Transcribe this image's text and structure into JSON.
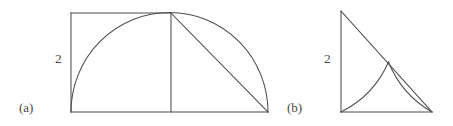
{
  "figure": {
    "background_color": "#ffffff",
    "stroke_color": "#4d4d4d",
    "panels": [
      {
        "id": "a",
        "caption": "(a)",
        "dimension_label": "2",
        "description": "Semicircle of radius 2 on a diameter, with an inscribed rectangle, a vertical radius to the apex, and a chord from the apex to the right end of the diameter.",
        "geometry": {
          "type": "semicircle-with-inscribed-rectangle",
          "center": [
            171,
            112
          ],
          "radius": 98,
          "diameter_left": [
            71,
            112
          ],
          "diameter_right": [
            268,
            112
          ],
          "apex": [
            171,
            13
          ],
          "rectangle": [
            [
              71,
              13
            ],
            [
              171,
              13
            ],
            [
              171,
              112
            ],
            [
              71,
              112
            ]
          ],
          "chord": [
            [
              171,
              13
            ],
            [
              268,
              112
            ]
          ]
        }
      },
      {
        "id": "b",
        "caption": "(b)",
        "dimension_label": "2",
        "description": "Right triangle of legs 2 with a quarter-circle arc from the bottom-left vertex and a second arc meeting it on the hypotenuse.",
        "geometry": {
          "type": "right-triangle-with-two-arcs",
          "top_left": [
            341,
            11
          ],
          "bottom_left": [
            341,
            112
          ],
          "bottom_right": [
            432,
            112
          ],
          "arc_intersection": [
            388,
            62
          ],
          "large_arc_center": [
            341,
            11
          ],
          "large_arc_radius": 101,
          "small_arc_center": [
            432,
            11
          ],
          "small_arc_radius": 101
        }
      }
    ]
  }
}
